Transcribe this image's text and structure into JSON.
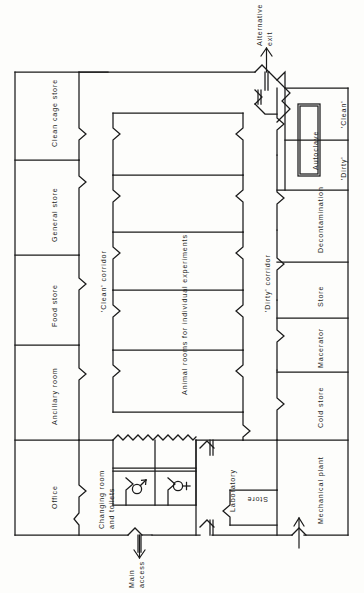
{
  "diagram": {
    "type": "architectural-floor-plan",
    "text_orientation": "rotated-90-ccw",
    "colors": {
      "wall": "#1a1a1a",
      "background": "#fdfdfb",
      "text": "#1d1d1d"
    }
  },
  "left_wing_rooms": [
    {
      "id": "clean-cage-store",
      "label": "Clean cage store"
    },
    {
      "id": "general-store",
      "label": "General store"
    },
    {
      "id": "food-store",
      "label": "Food store"
    },
    {
      "id": "ancillary-room",
      "label": "Ancillary room"
    },
    {
      "id": "office",
      "label": "Office"
    }
  ],
  "corridors": [
    {
      "id": "clean-corridor",
      "label": "'Clean' corridor"
    },
    {
      "id": "dirty-corridor",
      "label": "'Dirty' corridor"
    }
  ],
  "animal_rooms": {
    "label": "Animal rooms for individual experiments",
    "count": 5
  },
  "right_wing_rooms": [
    {
      "id": "clean-zone",
      "label": "'Clean'"
    },
    {
      "id": "dirty-zone",
      "label": "'Dirty'"
    },
    {
      "id": "decontamination",
      "label": "Decontamination"
    },
    {
      "id": "store-right",
      "label": "Store"
    },
    {
      "id": "macerator",
      "label": "Macerator"
    },
    {
      "id": "cold-store",
      "label": "Cold store"
    },
    {
      "id": "mechanical-plant",
      "label": "Mechanical plant"
    }
  ],
  "equipment": [
    {
      "id": "autoclave",
      "label": "Autoclave"
    }
  ],
  "bottom_rooms": [
    {
      "id": "changing-room-and-toilets",
      "label": "Changing room\nand toilets"
    },
    {
      "id": "laboratory",
      "label": "Laboratory"
    },
    {
      "id": "store-lab",
      "label": "Store"
    }
  ],
  "toilets": [
    {
      "id": "male-toilet",
      "symbol": "male-symbol"
    },
    {
      "id": "female-toilet",
      "symbol": "female-symbol"
    }
  ],
  "access_points": [
    {
      "id": "main-access",
      "label": "Main\naccess",
      "direction": "in"
    },
    {
      "id": "alternative-exit",
      "label": "Alternative\nexit",
      "direction": "out"
    }
  ]
}
